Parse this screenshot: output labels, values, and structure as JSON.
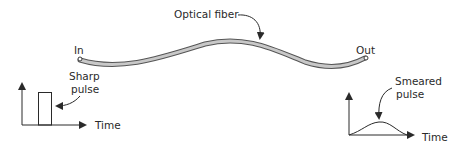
{
  "diagram": {
    "fiber_label": "Optical fiber",
    "in_label": "In",
    "out_label": "Out",
    "input_graph": {
      "pulse_label_line1": "Sharp",
      "pulse_label_line2": "pulse",
      "axis_label": "Time"
    },
    "output_graph": {
      "pulse_label_line1": "Smeared",
      "pulse_label_line2": "pulse",
      "axis_label": "Time"
    }
  },
  "colors": {
    "line": "#2a2a2a",
    "fiber_fill": "#c8c8c8",
    "fiber_edge": "#555555"
  }
}
